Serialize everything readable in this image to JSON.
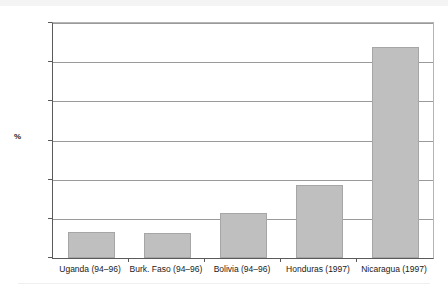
{
  "chart_data": {
    "type": "bar",
    "title": "",
    "subtitle": "",
    "xlabel": "",
    "ylabel": "%",
    "ylim": [
      0,
      300
    ],
    "ytick_values": [
      0,
      50,
      100,
      150,
      200,
      250,
      300
    ],
    "ytick_labels": [
      "0",
      "50",
      "100",
      "150",
      "200",
      "250",
      "300"
    ],
    "grid": "horizontal",
    "legend": "none",
    "categories": [
      "Uganda (94–96)",
      "Burk. Faso (94–96)",
      "Bolivia (94–96)",
      "Honduras (1997)",
      "Nicaragua (1997)"
    ],
    "values": [
      33,
      32,
      58,
      93,
      270
    ],
    "bar_color": "#bfbfbf",
    "bar_border_color": "#a6a6a6",
    "axis_color": "#5a5a5a",
    "gridline_color": "#9a9a9a",
    "background_color": "#ffffff"
  }
}
